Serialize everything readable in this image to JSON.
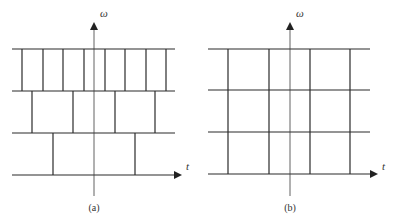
{
  "diagrams": [
    {
      "id": "a",
      "caption": "(a)",
      "y_axis_label": "ω",
      "x_axis_label": "t",
      "axis_x": 94,
      "rows": [
        {
          "y_top": 49,
          "y_bottom": 91,
          "dividers": [
            22,
            43,
            63,
            84,
            105,
            125,
            146,
            166
          ]
        },
        {
          "y_top": 91,
          "y_bottom": 133,
          "dividers": [
            32,
            73,
            115,
            155
          ]
        },
        {
          "y_top": 133,
          "y_bottom": 175,
          "dividers": [
            53,
            135
          ]
        }
      ],
      "horizontal_lines": [
        49,
        91,
        133,
        175
      ],
      "x_left": 12,
      "x_right": 175
    },
    {
      "id": "b",
      "caption": "(b)",
      "y_axis_label": "ω",
      "x_axis_label": "t",
      "axis_x": 290,
      "rows": [
        {
          "y_top": 49,
          "y_bottom": 90,
          "dividers": [
            228,
            269,
            310,
            350
          ]
        },
        {
          "y_top": 90,
          "y_bottom": 132,
          "dividers": [
            228,
            269,
            310,
            350
          ]
        },
        {
          "y_top": 132,
          "y_bottom": 174,
          "dividers": [
            228,
            269,
            310,
            350
          ]
        }
      ],
      "horizontal_lines": [
        49,
        90,
        132,
        174
      ],
      "x_left": 208,
      "x_right": 370
    }
  ]
}
